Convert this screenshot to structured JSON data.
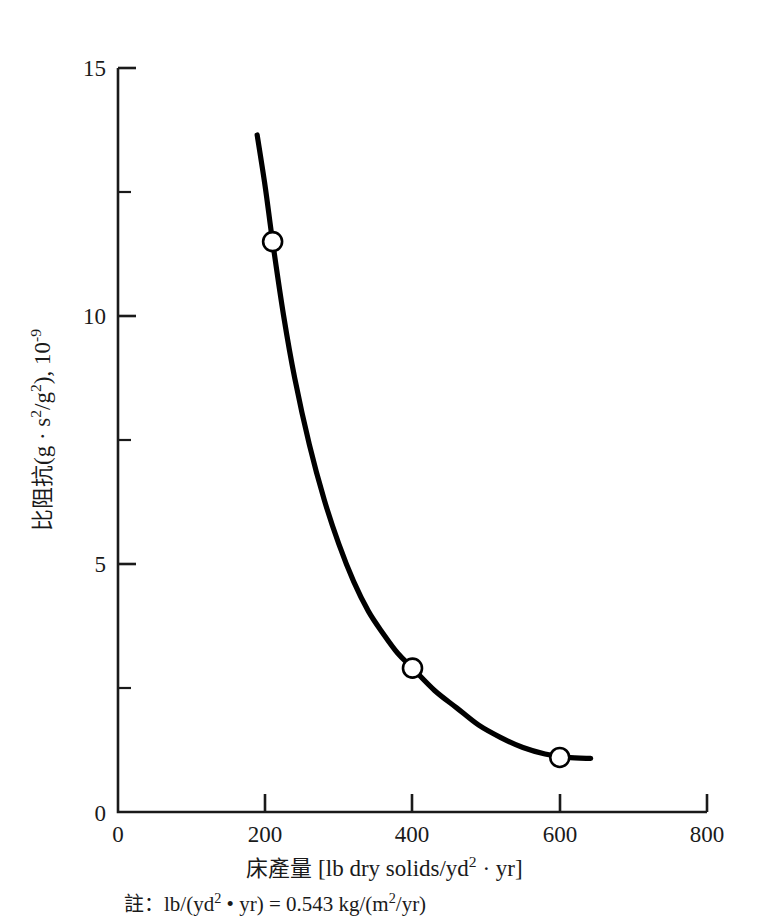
{
  "chart_data": {
    "type": "line",
    "title": "",
    "subtitle": "",
    "xlabel_cjk": "床產量",
    "xlabel_units": "[lb dry solids/yd",
    "xlabel_units_exp": "2",
    "xlabel_units_tail": " · yr]",
    "ylabel_cjk": "比阻抗",
    "ylabel_units_a": "(g · s",
    "ylabel_units_a_exp": "2",
    "ylabel_units_b": "/g",
    "ylabel_units_b_exp": "2",
    "ylabel_units_c": "), 10",
    "ylabel_units_c_exp": "-9",
    "note_cjk": "註",
    "note_sep": "：",
    "note_a": "lb/(yd",
    "note_a_exp": "2",
    "note_b": " • yr) = 0.543 kg/(m",
    "note_b_exp": "2",
    "note_c": "/yr)",
    "xlim": [
      0,
      800
    ],
    "ylim": [
      0,
      15
    ],
    "xticks": [
      0,
      200,
      400,
      600,
      800
    ],
    "xtick_labels": [
      "0",
      "200",
      "400",
      "600",
      "800"
    ],
    "xticks_minor": [
      100,
      300,
      500,
      700
    ],
    "yticks": [
      0,
      5,
      10,
      15
    ],
    "ytick_labels": [
      "0",
      "5",
      "10",
      "15"
    ],
    "yticks_minor": [
      2.5,
      7.5,
      12.5
    ],
    "grid": false,
    "legend_position": "none",
    "marker_style": "open-circle",
    "line_color": "#000000",
    "marker_face_color": "#ffffff",
    "marker_edge_color": "#000000",
    "points": [
      {
        "x": 210,
        "y": 11.5
      },
      {
        "x": 400,
        "y": 2.9
      },
      {
        "x": 600,
        "y": 1.1
      }
    ],
    "curve": [
      {
        "x": 189,
        "y": 13.65
      },
      {
        "x": 200,
        "y": 12.6
      },
      {
        "x": 210,
        "y": 11.5
      },
      {
        "x": 225,
        "y": 10.0
      },
      {
        "x": 240,
        "y": 8.75
      },
      {
        "x": 260,
        "y": 7.4
      },
      {
        "x": 280,
        "y": 6.3
      },
      {
        "x": 300,
        "y": 5.4
      },
      {
        "x": 320,
        "y": 4.65
      },
      {
        "x": 340,
        "y": 4.05
      },
      {
        "x": 360,
        "y": 3.6
      },
      {
        "x": 380,
        "y": 3.2
      },
      {
        "x": 400,
        "y": 2.9
      },
      {
        "x": 430,
        "y": 2.45
      },
      {
        "x": 460,
        "y": 2.1
      },
      {
        "x": 490,
        "y": 1.75
      },
      {
        "x": 520,
        "y": 1.5
      },
      {
        "x": 550,
        "y": 1.3
      },
      {
        "x": 580,
        "y": 1.17
      },
      {
        "x": 610,
        "y": 1.1
      },
      {
        "x": 642,
        "y": 1.08
      }
    ]
  },
  "axes": {
    "x_tick_0": "0",
    "x_tick_1": "200",
    "x_tick_2": "400",
    "x_tick_3": "600",
    "x_tick_4": "800",
    "y_tick_0": "0",
    "y_tick_1": "5",
    "y_tick_2": "10",
    "y_tick_3": "15"
  }
}
